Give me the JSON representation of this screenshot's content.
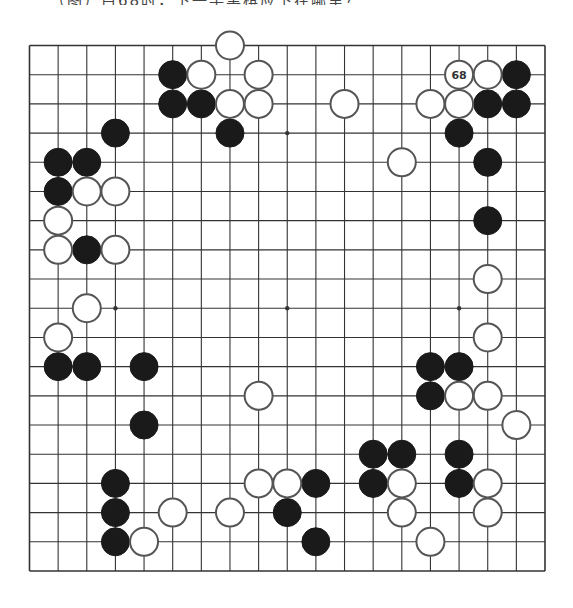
{
  "header": {
    "caption": "（图）白68时，下一手黑棋应下在哪里？"
  },
  "board": {
    "size": 19,
    "line_color": "#333333",
    "black_color": "#1a1a1a",
    "white_color": "#ffffff",
    "stone_outline": "#555555",
    "hoshi": [
      [
        3,
        3
      ],
      [
        9,
        3
      ],
      [
        15,
        3
      ],
      [
        3,
        9
      ],
      [
        9,
        9
      ],
      [
        15,
        9
      ],
      [
        3,
        15
      ],
      [
        9,
        15
      ],
      [
        15,
        15
      ]
    ],
    "black_stones": [
      [
        5,
        1
      ],
      [
        5,
        2
      ],
      [
        6,
        2
      ],
      [
        7,
        3
      ],
      [
        3,
        3
      ],
      [
        1,
        4
      ],
      [
        2,
        4
      ],
      [
        1,
        5
      ],
      [
        2,
        7
      ],
      [
        1,
        11
      ],
      [
        2,
        11
      ],
      [
        4,
        11
      ],
      [
        4,
        13
      ],
      [
        3,
        15
      ],
      [
        3,
        16
      ],
      [
        3,
        17
      ],
      [
        10,
        15
      ],
      [
        9,
        16
      ],
      [
        10,
        17
      ],
      [
        17,
        1
      ],
      [
        16,
        2
      ],
      [
        17,
        2
      ],
      [
        15,
        3
      ],
      [
        16,
        4
      ],
      [
        16,
        6
      ],
      [
        14,
        11
      ],
      [
        15,
        11
      ],
      [
        14,
        12
      ],
      [
        12,
        14
      ],
      [
        13,
        14
      ],
      [
        15,
        14
      ],
      [
        12,
        15
      ],
      [
        15,
        15
      ]
    ],
    "white_stones": [
      [
        7,
        0
      ],
      [
        6,
        1
      ],
      [
        8,
        1
      ],
      [
        7,
        2
      ],
      [
        8,
        2
      ],
      [
        11,
        2
      ],
      [
        16,
        1
      ],
      [
        14,
        2
      ],
      [
        15,
        2
      ],
      [
        2,
        5
      ],
      [
        3,
        5
      ],
      [
        1,
        6
      ],
      [
        1,
        7
      ],
      [
        3,
        7
      ],
      [
        2,
        9
      ],
      [
        1,
        10
      ],
      [
        13,
        4
      ],
      [
        16,
        8
      ],
      [
        16,
        10
      ],
      [
        15,
        12
      ],
      [
        16,
        12
      ],
      [
        17,
        13
      ],
      [
        8,
        12
      ],
      [
        8,
        15
      ],
      [
        9,
        15
      ],
      [
        5,
        16
      ],
      [
        7,
        16
      ],
      [
        4,
        17
      ],
      [
        13,
        15
      ],
      [
        16,
        15
      ],
      [
        13,
        16
      ],
      [
        16,
        16
      ],
      [
        14,
        17
      ]
    ],
    "labeled_stones": [
      {
        "col": 15,
        "row": 1,
        "color": "white",
        "label": "68"
      }
    ]
  }
}
